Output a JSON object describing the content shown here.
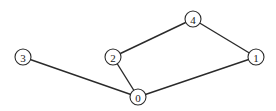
{
  "graph": {
    "nodes": [
      {
        "id": "0",
        "label": "0",
        "x": 138,
        "y": 97
      },
      {
        "id": "1",
        "label": "1",
        "x": 256,
        "y": 57
      },
      {
        "id": "2",
        "label": "2",
        "x": 113,
        "y": 57
      },
      {
        "id": "3",
        "label": "3",
        "x": 23,
        "y": 57
      },
      {
        "id": "4",
        "label": "4",
        "x": 193,
        "y": 19
      }
    ],
    "edges": [
      {
        "from": "3",
        "to": "0"
      },
      {
        "from": "2",
        "to": "0"
      },
      {
        "from": "0",
        "to": "1"
      },
      {
        "from": "2",
        "to": "4"
      },
      {
        "from": "4",
        "to": "1"
      }
    ],
    "node_radius": 8,
    "colors": {
      "stroke": "#2a2a2a",
      "fill": "#ffffff",
      "background": "#ffffff"
    }
  }
}
